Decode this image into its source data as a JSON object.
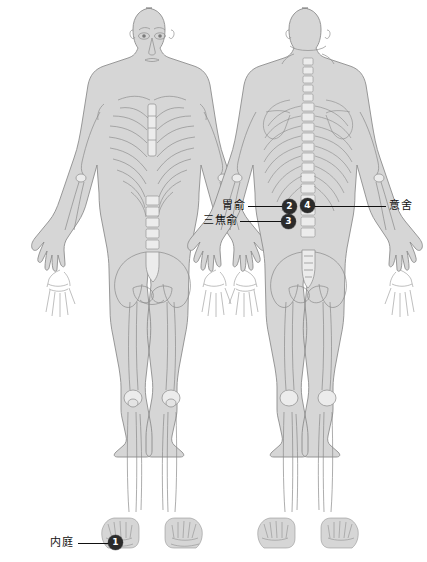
{
  "canvas": {
    "width": 427,
    "height": 562,
    "background": "#ffffff"
  },
  "figures": [
    {
      "id": "anterior",
      "view_label": "anterior",
      "center_x": 152
    },
    {
      "id": "posterior",
      "view_label": "posterior",
      "center_x": 308
    }
  ],
  "palette": {
    "body_fill": "#d6d6d6",
    "body_edge": "#8d8d8d",
    "bone_fill": "#ececec",
    "bone_line": "#8a8a8a",
    "marker_fill": "#2b2b2b",
    "marker_text": "#ffffff",
    "leader_line": "#111111",
    "label_text": "#111111"
  },
  "annotations": [
    {
      "id": "weishu",
      "label": "胃俞",
      "number": "2",
      "label_x": 222,
      "label_y": 200,
      "line_x": 248,
      "line_y": 206,
      "line_w": 38,
      "marker_x": 282,
      "marker_y": 199,
      "marker_d": 15,
      "side": "left"
    },
    {
      "id": "sanjiaoshu",
      "label": "三焦俞",
      "number": "3",
      "label_x": 203,
      "label_y": 215,
      "line_x": 240,
      "line_y": 221,
      "line_w": 46,
      "marker_x": 281,
      "marker_y": 214,
      "marker_d": 15,
      "side": "left"
    },
    {
      "id": "yishe",
      "label": "意舍",
      "number": "4",
      "label_x": 389,
      "label_y": 200,
      "line_x": 313,
      "line_y": 206,
      "line_w": 73,
      "marker_x": 300,
      "marker_y": 198,
      "marker_d": 15,
      "side": "right"
    },
    {
      "id": "neiting",
      "label": "内庭",
      "number": "1",
      "label_x": 50,
      "label_y": 537,
      "line_x": 78,
      "line_y": 543,
      "line_w": 33,
      "marker_x": 108,
      "marker_y": 535,
      "marker_d": 15,
      "side": "left"
    }
  ]
}
